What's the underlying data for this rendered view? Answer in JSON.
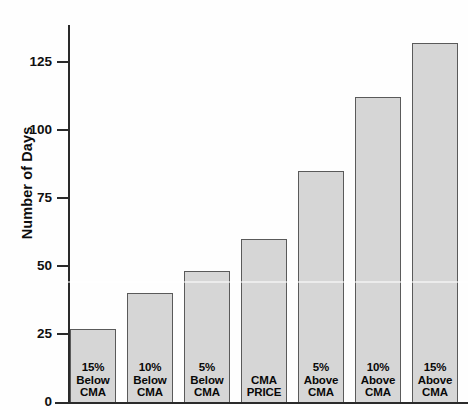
{
  "chart_data": {
    "type": "bar",
    "title": "",
    "xlabel": "",
    "ylabel": "Number of Days",
    "categories": [
      "15% Below CMA",
      "10% Below CMA",
      "5% Below CMA",
      "CMA PRICE",
      "5% Above CMA",
      "10% Above CMA",
      "15% Above CMA"
    ],
    "category_lines": [
      [
        "15%",
        "Below",
        "CMA"
      ],
      [
        "10%",
        "Below",
        "CMA"
      ],
      [
        "5%",
        "Below",
        "CMA"
      ],
      [
        "CMA",
        "PRICE"
      ],
      [
        "5%",
        "Above",
        "CMA"
      ],
      [
        "10%",
        "Above",
        "CMA"
      ],
      [
        "15%",
        "Above",
        "CMA"
      ]
    ],
    "values": [
      27,
      40,
      48,
      60,
      85,
      112,
      132
    ],
    "ylim": [
      0,
      140
    ],
    "y_ticks": [
      0,
      25,
      50,
      75,
      100,
      125
    ],
    "y_tick_labels": [
      "0",
      "25",
      "50",
      "75",
      "100",
      "125"
    ],
    "grid": false,
    "legend": false,
    "bar_fill_color": "#d6d6d6",
    "bar_border_color": "#5a5a5a",
    "axis_color": "#2a2a2a",
    "text_color": "#0d0d0d"
  }
}
